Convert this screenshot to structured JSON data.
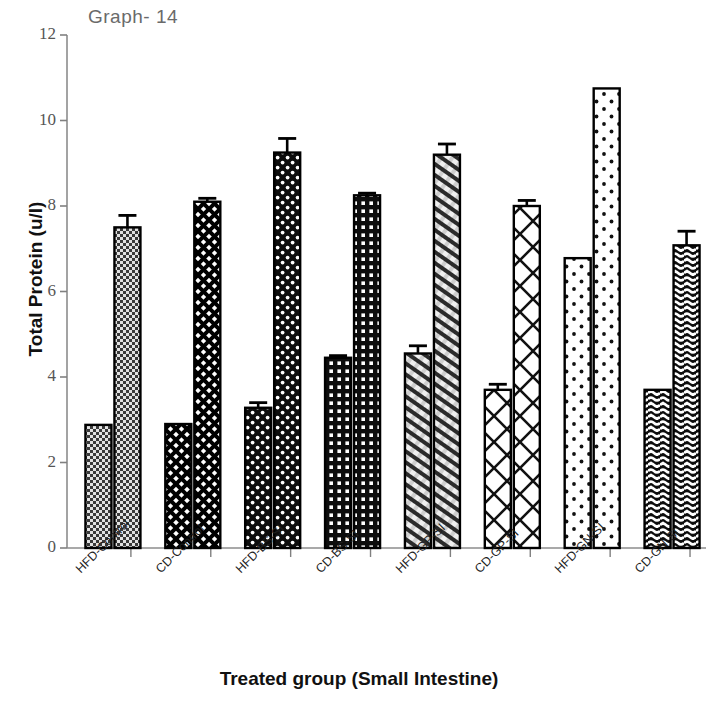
{
  "figure": {
    "title": "Graph- 14",
    "x_axis_title": "Treated group (Small Intestine)",
    "y_axis_title": "Total Protein (u/l)"
  },
  "axis": {
    "y_ticks": [
      "0",
      "2",
      "4",
      "6",
      "8",
      "10",
      "12"
    ],
    "x_ticks": [
      "HFD-Control",
      "CD-Control",
      "HFD-BS-SI",
      "CD-BS-SI",
      "HFD-GP-SI",
      "CD-GP-SI",
      "HFD-GN-SI",
      "CD-GN-SI"
    ]
  },
  "chart_data": {
    "type": "bar",
    "title": "Graph- 14",
    "xlabel": "Treated group (Small Intestine)",
    "ylabel": "Total Protein (u/l)",
    "ylim": [
      0,
      12
    ],
    "ytick_step": 2,
    "grid": false,
    "legend": "none",
    "categories": [
      "HFD-Control",
      "CD-Control",
      "HFD-BS-SI",
      "CD-BS-SI",
      "HFD-GP-SI",
      "CD-GP-SI",
      "HFD-GN-SI",
      "CD-GN-SI"
    ],
    "series": [
      {
        "name": "Series 1",
        "values": [
          2.88,
          2.9,
          3.28,
          4.45,
          4.55,
          3.7,
          6.78,
          3.7
        ],
        "errors": [
          0,
          0,
          0.12,
          0.05,
          0.18,
          0.13,
          0,
          0
        ]
      },
      {
        "name": "Series 2",
        "values": [
          7.5,
          8.1,
          9.25,
          8.25,
          9.2,
          8.0,
          10.75,
          7.08
        ],
        "errors": [
          0.28,
          0.08,
          0.33,
          0.05,
          0.25,
          0.13,
          0,
          0.33
        ]
      }
    ],
    "bars": [
      {
        "category": "HFD-Control",
        "series": "Series 1",
        "value": 2.88,
        "error": 0,
        "pattern": "fine-dot-light"
      },
      {
        "category": "HFD-Control",
        "series": "Series 2",
        "value": 7.5,
        "error": 0.28,
        "pattern": "fine-dot-light"
      },
      {
        "category": "CD-Control",
        "series": "Series 1",
        "value": 2.9,
        "error": 0,
        "pattern": "small-crosshatch-dark"
      },
      {
        "category": "CD-Control",
        "series": "Series 2",
        "value": 8.1,
        "error": 0.08,
        "pattern": "small-crosshatch-dark"
      },
      {
        "category": "HFD-BS-SI",
        "series": "Series 1",
        "value": 3.28,
        "error": 0.12,
        "pattern": "black-dot-grid"
      },
      {
        "category": "HFD-BS-SI",
        "series": "Series 2",
        "value": 9.25,
        "error": 0.33,
        "pattern": "black-dot-grid"
      },
      {
        "category": "CD-BS-SI",
        "series": "Series 1",
        "value": 4.45,
        "error": 0.05,
        "pattern": "black-square-grid"
      },
      {
        "category": "CD-BS-SI",
        "series": "Series 2",
        "value": 8.25,
        "error": 0.05,
        "pattern": "black-square-grid"
      },
      {
        "category": "HFD-GP-SI",
        "series": "Series 1",
        "value": 4.55,
        "error": 0.18,
        "pattern": "diagonal-hatch-light"
      },
      {
        "category": "HFD-GP-SI",
        "series": "Series 2",
        "value": 9.2,
        "error": 0.25,
        "pattern": "diagonal-hatch-light"
      },
      {
        "category": "CD-GP-SI",
        "series": "Series 1",
        "value": 3.7,
        "error": 0.13,
        "pattern": "large-lattice-white"
      },
      {
        "category": "CD-GP-SI",
        "series": "Series 2",
        "value": 8.0,
        "error": 0.13,
        "pattern": "large-lattice-white"
      },
      {
        "category": "HFD-GN-SI",
        "series": "Series 1",
        "value": 6.78,
        "error": 0,
        "pattern": "sparse-dot-white"
      },
      {
        "category": "HFD-GN-SI",
        "series": "Series 2",
        "value": 10.75,
        "error": 0,
        "pattern": "sparse-dot-white"
      },
      {
        "category": "CD-GN-SI",
        "series": "Series 1",
        "value": 3.7,
        "error": 0,
        "pattern": "wave-dark"
      },
      {
        "category": "CD-GN-SI",
        "series": "Series 2",
        "value": 7.08,
        "error": 0.33,
        "pattern": "wave-dark"
      }
    ],
    "colors": {
      "bar_outline": "#000000",
      "bar_fill_light": "#d8d8d8",
      "bar_fill_dark": "#111111",
      "axis": "#808080",
      "text": "#1a1a1a",
      "title": "#6a6a6a"
    }
  }
}
